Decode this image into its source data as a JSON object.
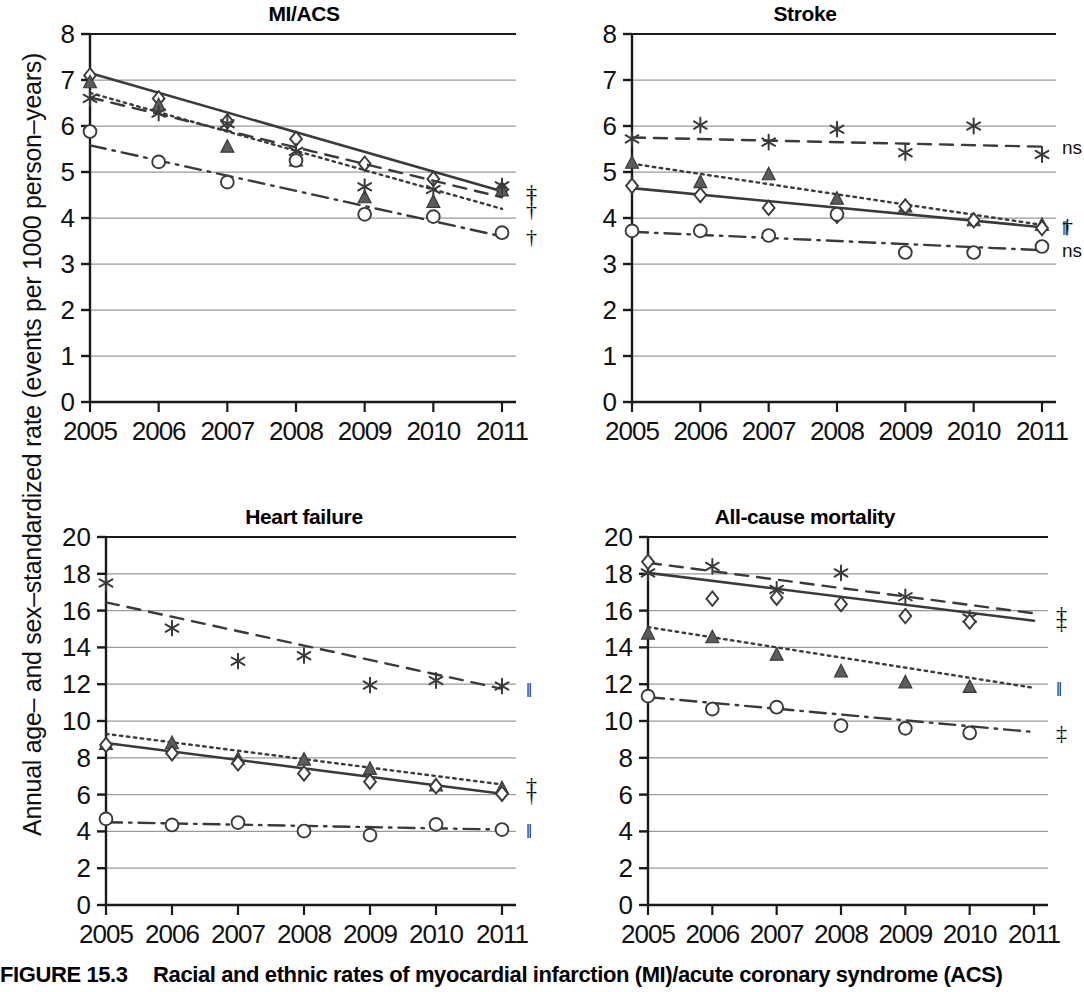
{
  "figure": {
    "number": "FIGURE 15.3",
    "caption": "Racial and ethnic rates of myocardial infarction (MI)/acute coronary syndrome (ACS)",
    "y_axis_label": "Annual age– and sex–standardized rate (events per 1000 person–years)"
  },
  "axis": {
    "x_ticks": [
      "2005",
      "2006",
      "2007",
      "2008",
      "2009",
      "2010",
      "2011"
    ],
    "y_ticks_top": [
      "0",
      "1",
      "2",
      "3",
      "4",
      "5",
      "6",
      "7",
      "8"
    ],
    "y_ticks_bottom": [
      "0",
      "2",
      "4",
      "6",
      "8",
      "10",
      "12",
      "14",
      "16",
      "18",
      "20"
    ]
  },
  "series_styles": {
    "diamond_solid": {
      "marker": "diamond",
      "line": "solid"
    },
    "triangle_dotted": {
      "marker": "triangle",
      "line": "dotted"
    },
    "asterisk_dashed": {
      "marker": "asterisk",
      "line": "dashed"
    },
    "circle_dashdot": {
      "marker": "circle",
      "line": "dashdot"
    }
  },
  "colors": {
    "ink": "#3a3a3a",
    "grid": "#9a9a9a",
    "axis": "#1a1a1a",
    "text": "#111111"
  },
  "chart_data": [
    {
      "id": "mi-acs",
      "type": "line",
      "title": "MI/ACS",
      "xlabel": "",
      "ylabel": "Annual age– and sex–standardized rate (events per 1000 person–years)",
      "x": [
        2005,
        2006,
        2007,
        2008,
        2009,
        2010,
        2011
      ],
      "xlim": [
        2005,
        2011
      ],
      "ylim": [
        0,
        8
      ],
      "yticks": [
        0,
        1,
        2,
        3,
        4,
        5,
        6,
        7,
        8
      ],
      "grid": true,
      "legend": "none",
      "series": [
        {
          "name": "diamond_solid",
          "marker": "diamond",
          "line": "solid",
          "values": [
            7.1,
            6.6,
            6.1,
            5.72,
            5.18,
            4.85,
            4.62
          ],
          "trend": [
            7.15,
            4.58
          ],
          "significance": "†"
        },
        {
          "name": "triangle_dotted",
          "marker": "triangle",
          "line": "dotted",
          "values": [
            6.95,
            6.45,
            5.55,
            5.25,
            4.45,
            4.35,
            4.6
          ],
          "trend": [
            6.72,
            4.2
          ],
          "significance": "†"
        },
        {
          "name": "asterisk_dashed",
          "marker": "asterisk",
          "line": "dashed",
          "values": [
            6.6,
            6.28,
            6.05,
            5.45,
            4.68,
            4.62,
            4.7
          ],
          "trend": [
            6.62,
            4.45
          ],
          "significance": "†"
        },
        {
          "name": "circle_dashdot",
          "marker": "circle",
          "line": "dashdot",
          "values": [
            5.88,
            5.22,
            4.78,
            5.25,
            4.08,
            4.03,
            3.68
          ],
          "trend": [
            5.58,
            3.6
          ],
          "significance": "†"
        }
      ],
      "significance_markers": [
        "†",
        "†",
        "†",
        "†"
      ]
    },
    {
      "id": "stroke",
      "type": "line",
      "title": "Stroke",
      "xlabel": "",
      "ylabel": "",
      "x": [
        2005,
        2006,
        2007,
        2008,
        2009,
        2010,
        2011
      ],
      "xlim": [
        2005,
        2011
      ],
      "ylim": [
        0,
        8
      ],
      "yticks": [
        0,
        1,
        2,
        3,
        4,
        5,
        6,
        7,
        8
      ],
      "grid": true,
      "legend": "none",
      "series": [
        {
          "name": "asterisk_dashed",
          "marker": "asterisk",
          "line": "dashed",
          "values": [
            5.72,
            6.02,
            5.65,
            5.93,
            5.42,
            6.0,
            5.38
          ],
          "trend": [
            5.75,
            5.55
          ],
          "significance": "ns"
        },
        {
          "name": "triangle_dotted",
          "marker": "triangle",
          "line": "dotted",
          "values": [
            5.2,
            4.78,
            4.95,
            4.42,
            4.25,
            3.95,
            3.85
          ],
          "trend": [
            5.18,
            3.85
          ],
          "significance": "†"
        },
        {
          "name": "diamond_solid",
          "marker": "diamond",
          "line": "solid",
          "values": [
            4.7,
            4.5,
            4.22,
            4.05,
            4.25,
            3.95,
            3.78
          ],
          "trend": [
            4.65,
            3.8
          ],
          "significance": "‖"
        },
        {
          "name": "circle_dashdot",
          "marker": "circle",
          "line": "dashdot",
          "values": [
            3.72,
            3.72,
            3.62,
            4.08,
            3.25,
            3.25,
            3.38
          ],
          "trend": [
            3.7,
            3.3
          ],
          "significance": "ns"
        }
      ],
      "significance_markers": [
        "ns",
        "†",
        "‖",
        "ns"
      ]
    },
    {
      "id": "heart-failure",
      "type": "line",
      "title": "Heart failure",
      "xlabel": "",
      "ylabel": "",
      "x": [
        2005,
        2006,
        2007,
        2008,
        2009,
        2010,
        2011
      ],
      "xlim": [
        2005,
        2011
      ],
      "ylim": [
        0,
        20
      ],
      "yticks": [
        0,
        2,
        4,
        6,
        8,
        10,
        12,
        14,
        16,
        18,
        20
      ],
      "grid": true,
      "legend": "none",
      "series": [
        {
          "name": "asterisk_dashed",
          "marker": "asterisk",
          "line": "dashed",
          "values": [
            17.5,
            15.05,
            13.25,
            13.55,
            11.95,
            12.2,
            11.9
          ],
          "trend": [
            16.45,
            11.75
          ],
          "significance": "‖"
        },
        {
          "name": "triangle_dotted",
          "marker": "triangle",
          "line": "dotted",
          "values": [
            8.75,
            8.8,
            7.95,
            7.9,
            7.4,
            6.5,
            6.35
          ],
          "trend": [
            9.3,
            6.55
          ],
          "significance": "†"
        },
        {
          "name": "diamond_solid",
          "marker": "diamond",
          "line": "solid",
          "values": [
            8.7,
            8.25,
            7.7,
            7.15,
            6.7,
            6.45,
            6.05
          ],
          "trend": [
            8.8,
            6.05
          ],
          "significance": "†"
        },
        {
          "name": "circle_dashdot",
          "marker": "circle",
          "line": "dashdot",
          "values": [
            4.68,
            4.35,
            4.48,
            4.02,
            3.8,
            4.38,
            4.1
          ],
          "trend": [
            4.5,
            4.1
          ],
          "significance": "‖"
        }
      ],
      "significance_markers": [
        "‖",
        "†",
        "†",
        "‖"
      ]
    },
    {
      "id": "all-cause-mortality",
      "type": "line",
      "title": "All-cause mortality",
      "xlabel": "",
      "ylabel": "",
      "x": [
        2005,
        2006,
        2007,
        2008,
        2009,
        2010,
        2011
      ],
      "xlim": [
        2005,
        2011
      ],
      "ylim": [
        0,
        20
      ],
      "yticks": [
        0,
        2,
        4,
        6,
        8,
        10,
        12,
        14,
        16,
        18,
        20
      ],
      "grid": true,
      "legend": "none",
      "series": [
        {
          "name": "asterisk_dashed",
          "marker": "asterisk",
          "line": "dashed",
          "values": [
            18.05,
            18.4,
            17.15,
            18.05,
            16.75,
            15.6,
            null
          ],
          "trend": [
            18.6,
            15.85
          ],
          "significance": "†"
        },
        {
          "name": "diamond_solid",
          "marker": "diamond",
          "line": "solid",
          "values": [
            18.65,
            16.65,
            16.7,
            16.35,
            15.7,
            15.4,
            null
          ],
          "trend": [
            18.05,
            15.45
          ],
          "significance": "‡"
        },
        {
          "name": "triangle_dotted",
          "marker": "triangle",
          "line": "dotted",
          "values": [
            14.75,
            14.55,
            13.6,
            12.7,
            12.1,
            11.85,
            null
          ],
          "trend": [
            15.1,
            11.8
          ],
          "significance": "‖"
        },
        {
          "name": "circle_dashdot",
          "marker": "circle",
          "line": "dashdot",
          "values": [
            11.35,
            10.65,
            10.75,
            9.75,
            9.6,
            9.35,
            null
          ],
          "trend": [
            11.3,
            9.4
          ],
          "significance": "‡"
        }
      ],
      "significance_markers": [
        "†",
        "‡",
        "‖",
        "‡"
      ]
    }
  ]
}
